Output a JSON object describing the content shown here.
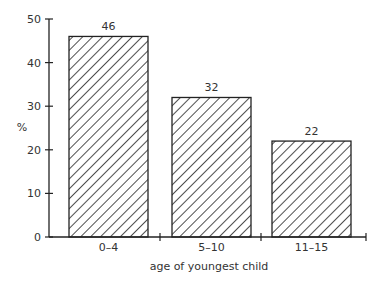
{
  "chart_data": {
    "type": "bar",
    "title": "",
    "xlabel": "age of youngest child",
    "ylabel": "%",
    "categories": [
      "0–4",
      "5–10",
      "11–15"
    ],
    "values": [
      46,
      32,
      22
    ],
    "data_labels": [
      "46",
      "32",
      "22"
    ],
    "yticks": [
      "0",
      "10",
      "20",
      "30",
      "40",
      "50"
    ],
    "ylim": [
      0,
      50
    ],
    "grid": false,
    "bar_fill": "diagonal-hatch",
    "colors": {
      "stroke": "#222222",
      "background": "#ffffff"
    }
  }
}
